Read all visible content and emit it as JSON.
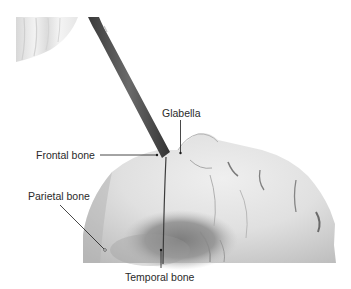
{
  "figure": {
    "labels": {
      "glabella": "Glabella",
      "frontal_bone": "Frontal bone",
      "parietal_bone": "Parietal bone",
      "temporal_bone": "Temporal bone"
    },
    "colors": {
      "background": "#ffffff",
      "label_text": "#2a2a2a",
      "leader_line": "#1a1a1a",
      "probe": "#4a4a4a",
      "skin_light": "#e6e6e6",
      "skin_mid": "#c8c8c8",
      "skin_dark": "#8a8a8a"
    }
  }
}
